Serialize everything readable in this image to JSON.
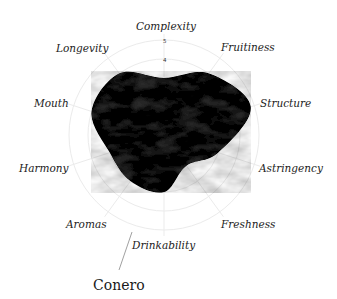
{
  "chart_data": {
    "type": "radar",
    "title": "Conero",
    "axes": [
      "Complexity",
      "Fruitiness",
      "Structure",
      "Astringency",
      "Freshness",
      "Drinkability",
      "Aromas",
      "Harmony",
      "Mouth",
      "Longevity"
    ],
    "series": [
      {
        "name": "Conero",
        "values": [
          3,
          4,
          4.8,
          3,
          2,
          3,
          3,
          3,
          4,
          4
        ]
      }
    ],
    "scale": {
      "min": 0,
      "max": 5,
      "rings": [
        1,
        2,
        3,
        4,
        5
      ],
      "visible_tick_labels": [
        "4",
        "5"
      ]
    },
    "grid": true,
    "fill_color": "#2b2b2b",
    "grid_color": "#ebebeb"
  },
  "labels": {
    "complexity": "Complexity",
    "fruitiness": "Fruitiness",
    "structure": "Structure",
    "astringency": "Astringency",
    "freshness": "Freshness",
    "drinkability": "Drinkability",
    "aromas": "Aromas",
    "harmony": "Harmony",
    "mouth": "Mouth",
    "longevity": "Longevity",
    "tick_4": "4",
    "tick_5": "5",
    "series_name": "Conero"
  }
}
